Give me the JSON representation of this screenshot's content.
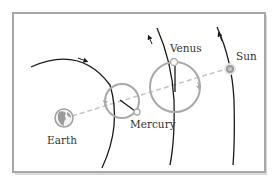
{
  "diagram": {
    "labels": {
      "earth": "Earth",
      "mercury": "Mercury",
      "venus": "Venus",
      "sun": "Sun"
    },
    "colors": {
      "frame": "#a8a8a8",
      "orbit": "#1a1a1a",
      "epicycle": "#a9a9a9",
      "dashed_line": "#c4c4c4",
      "sun_fill": "#9a9a9a",
      "text": "#333333"
    },
    "icons": {
      "earth": "globe-icon",
      "sun": "sun-icon"
    }
  }
}
